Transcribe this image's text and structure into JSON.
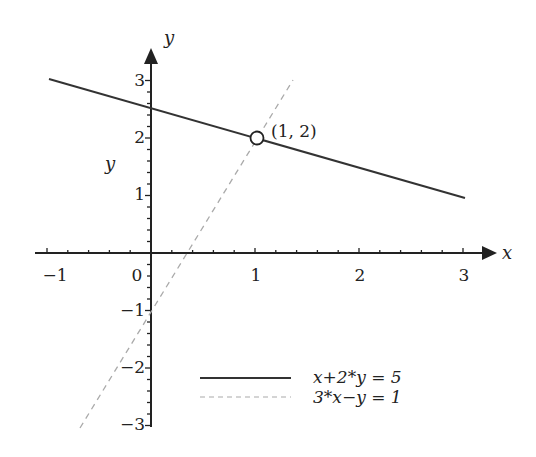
{
  "chart_data": {
    "type": "line",
    "title": "",
    "xlabel": "x",
    "ylabel": "y",
    "side_label": "y",
    "xlim": [
      -1,
      3
    ],
    "ylim": [
      -3,
      3
    ],
    "grid": false,
    "x_ticks": [
      "-1",
      "0",
      "1",
      "2",
      "3"
    ],
    "y_ticks": [
      "3",
      "2",
      "1",
      "-1",
      "-2",
      "-3"
    ],
    "series": [
      {
        "name": "x+2*y = 5",
        "style": "solid",
        "color": "#333333",
        "x": [
          -1,
          3
        ],
        "y": [
          3,
          1
        ]
      },
      {
        "name": "3*x-y = 1",
        "style": "dashed",
        "color": "#aaaaaa",
        "x": [
          -0.67,
          1.33
        ],
        "y": [
          -3,
          3
        ]
      }
    ],
    "annotations": [
      {
        "type": "point",
        "marker": "open-circle",
        "x": 1,
        "y": 2,
        "label": "(1, 2)"
      }
    ],
    "legend": {
      "position": "lower-right",
      "entries": [
        "x+2*y = 5",
        "3*x-y = 1"
      ]
    }
  },
  "labels": {
    "x_axis": "x",
    "y_axis": "y",
    "side": "y",
    "point": "(1, 2)",
    "legend_1": "x+2*y = 5",
    "legend_2": "3*x−y = 1",
    "ticks": {
      "xm1": "−1",
      "x0": "0",
      "x1": "1",
      "x2": "2",
      "x3": "3",
      "y3": "3",
      "y2": "2",
      "y1": "1",
      "ym1": "−1",
      "ym2": "−2",
      "ym3": "−3"
    }
  }
}
